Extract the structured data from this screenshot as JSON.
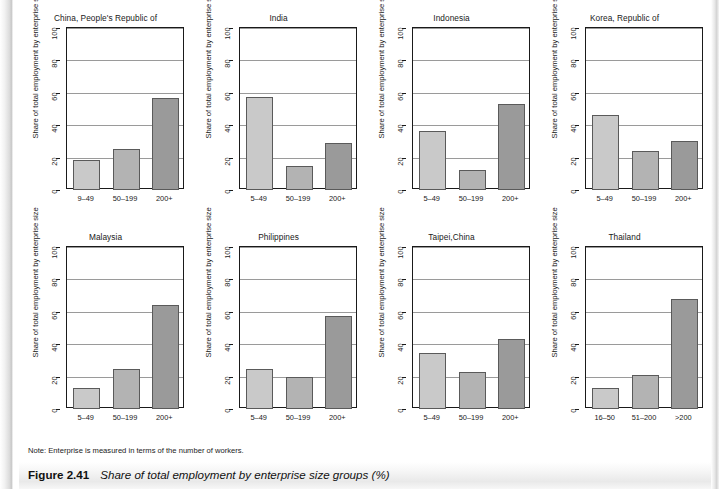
{
  "figure": {
    "caption_label": "Figure 2.41",
    "caption_text": "Share of total employment by enterprise size groups (%)",
    "note": "Note: Enterprise is measured in terms of the number of workers.",
    "y_axis_title": "Share of total employment by enterprise size"
  },
  "colors": {
    "bar_small": "#c9c9c9",
    "bar_medium": "#b3b3b3",
    "bar_large": "#9a9a9a",
    "bar_border": "#5a5a5a",
    "axis": "#1a1a1a",
    "gridline": "#9a9a9a"
  },
  "chart_data": {
    "type": "bar",
    "title": "Share of total employment by enterprise size groups (%)",
    "xlabel": "",
    "ylabel": "Share of total employment by enterprise size",
    "ylim": [
      0,
      100
    ],
    "yticks": [
      0,
      20,
      40,
      60,
      80,
      100
    ],
    "grid": true,
    "legend": "none",
    "note": "Note: Enterprise is measured in terms of the number of workers.",
    "panels": [
      {
        "title": "China, People's Republic of",
        "categories": [
          "9–49",
          "50–199",
          "200+"
        ],
        "values": [
          18.5,
          25.5,
          57.0
        ]
      },
      {
        "title": "India",
        "categories": [
          "5–49",
          "50–199",
          "200+"
        ],
        "values": [
          57.5,
          15.0,
          29.0
        ]
      },
      {
        "title": "Indonesia",
        "categories": [
          "5–49",
          "50–199",
          "200+"
        ],
        "values": [
          36.5,
          12.5,
          53.0
        ]
      },
      {
        "title": "Korea, Republic of",
        "categories": [
          "5–49",
          "50–199",
          "200+"
        ],
        "values": [
          46.5,
          24.0,
          30.0
        ]
      },
      {
        "title": "Malaysia",
        "categories": [
          "5–49",
          "50–199",
          "200+"
        ],
        "values": [
          13.0,
          24.5,
          64.5
        ]
      },
      {
        "title": "Philippines",
        "categories": [
          "5–49",
          "50–199",
          "200+"
        ],
        "values": [
          24.5,
          19.5,
          57.5
        ]
      },
      {
        "title": "Taipei,China",
        "categories": [
          "5–49",
          "50–199",
          "200+"
        ],
        "values": [
          34.5,
          23.0,
          43.0
        ]
      },
      {
        "title": "Thailand",
        "categories": [
          "16–50",
          "51–200",
          ">200"
        ],
        "values": [
          13.0,
          21.0,
          68.0
        ]
      }
    ]
  }
}
